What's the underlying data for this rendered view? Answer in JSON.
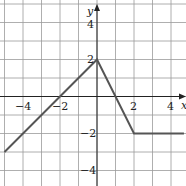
{
  "chart_data": {
    "type": "line",
    "title": "",
    "xlabel": "x",
    "ylabel": "y",
    "xlim": [
      -5,
      4.7
    ],
    "ylim": [
      -5,
      5.1
    ],
    "grid": true,
    "x_ticks": [
      -4,
      -2,
      2,
      4
    ],
    "y_ticks": [
      4,
      2,
      -2,
      -4
    ],
    "x_tick_labels": [
      "−4",
      "−2",
      "2",
      "4"
    ],
    "y_tick_labels": [
      "4",
      "2",
      "−2",
      "−4"
    ],
    "series": [
      {
        "name": "piecewise graph",
        "points": [
          [
            -5,
            -3
          ],
          [
            0,
            2
          ],
          [
            2,
            -2
          ],
          [
            4.7,
            -2
          ]
        ]
      }
    ]
  },
  "labels": {
    "x_axis": "x",
    "y_axis": "y",
    "xt0": "−4",
    "xt1": "−2",
    "xt2": "2",
    "xt3": "4",
    "yt0": "4",
    "yt1": "2",
    "yt2": "−2",
    "yt3": "−4"
  }
}
